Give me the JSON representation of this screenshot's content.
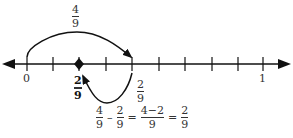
{
  "diagram": {
    "type": "number_line",
    "range": [
      0,
      1
    ],
    "divisions": 9,
    "tick_labels": {
      "start": "0",
      "end": "1"
    },
    "jump_forward": {
      "from": "0",
      "to": "4/9",
      "label_num": "4",
      "label_den": "9"
    },
    "jump_backward": {
      "from": "4/9",
      "to": "2/9",
      "label_num": "2",
      "label_den": "9"
    },
    "marked_point": {
      "num": "2",
      "den": "9"
    },
    "equation": {
      "t1_num": "4",
      "t1_den": "9",
      "minus": "–",
      "t2_num": "2",
      "t2_den": "9",
      "eq1": "=",
      "t3_num": "4−2",
      "t3_den": "9",
      "eq2": "=",
      "t4_num": "2",
      "t4_den": "9"
    }
  }
}
